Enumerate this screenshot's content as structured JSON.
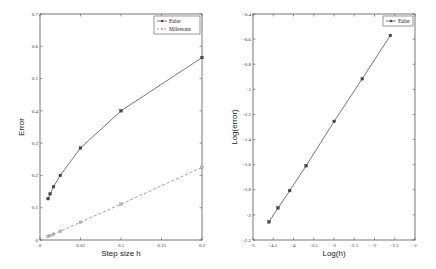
{
  "chart_data": [
    {
      "type": "line",
      "title": "",
      "xlabel": "Step size h",
      "ylabel": "Error",
      "xlim": [
        0,
        0.2
      ],
      "ylim": [
        0,
        0.7
      ],
      "xticks": [
        "0",
        "0.05",
        "0.1",
        "0.15",
        "0.2"
      ],
      "yticks": [
        "0",
        "0.1",
        "0.2",
        "0.3",
        "0.4",
        "0.5",
        "0.6",
        "0.7"
      ],
      "grid": false,
      "legend_position": "top-right",
      "series": [
        {
          "name": "Euler",
          "style": "solid",
          "marker": "square",
          "x": [
            0.01,
            0.0125,
            0.0167,
            0.025,
            0.05,
            0.1,
            0.2
          ],
          "y": [
            0.128,
            0.143,
            0.165,
            0.2,
            0.285,
            0.4,
            0.565
          ]
        },
        {
          "name": "Milestone",
          "style": "dashed",
          "marker": "square",
          "x": [
            0.01,
            0.0125,
            0.0167,
            0.025,
            0.05,
            0.1,
            0.2
          ],
          "y": [
            0.011,
            0.014,
            0.018,
            0.027,
            0.055,
            0.111,
            0.225
          ]
        }
      ]
    },
    {
      "type": "line",
      "title": "",
      "xlabel": "Log(h)",
      "ylabel": "Log(error)",
      "xlim": [
        -5,
        -1
      ],
      "ylim": [
        -2.2,
        -0.4
      ],
      "xticks": [
        "-5",
        "-4.5",
        "-4",
        "-3.5",
        "-3",
        "-2.5",
        "-2",
        "-1.5",
        "-1"
      ],
      "yticks": [
        "-2.2",
        "-2",
        "-1.8",
        "-1.6",
        "-1.4",
        "-1.2",
        "-1",
        "-0.8",
        "-0.6",
        "-0.4"
      ],
      "grid": false,
      "legend_position": "top-right",
      "series": [
        {
          "name": "Euler",
          "style": "solid",
          "marker": "square",
          "x": [
            -4.605,
            -4.382,
            -4.094,
            -3.689,
            -2.996,
            -2.303,
            -1.609
          ],
          "y": [
            -2.056,
            -1.945,
            -1.807,
            -1.609,
            -1.255,
            -0.916,
            -0.571
          ]
        }
      ]
    }
  ]
}
